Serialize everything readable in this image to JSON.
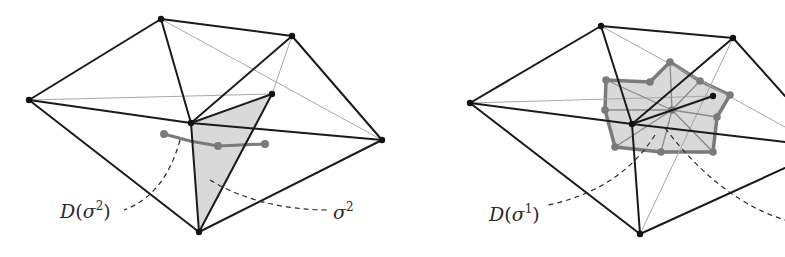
{
  "colors": {
    "edge": "#1a1a1a",
    "hidden_edge": "#a0a0a0",
    "fill": "#d9d9d9",
    "dual": "#7a7a7a",
    "vertex": "#111111"
  },
  "left_panel": {
    "label_dual": {
      "D": "D",
      "sigma": "σ",
      "exp": "2"
    },
    "label_simplex": {
      "sigma": "σ",
      "exp": "2"
    },
    "vertices": {
      "top": [
        161,
        19
      ],
      "upper_right": [
        292,
        36
      ],
      "left": [
        29,
        100
      ],
      "inner": [
        272,
        94
      ],
      "center": [
        191,
        123
      ],
      "right": [
        382,
        140
      ],
      "bottom": [
        199,
        232
      ]
    },
    "dual_curve_points": [
      [
        164,
        134
      ],
      [
        218,
        146
      ],
      [
        265,
        144
      ]
    ]
  },
  "right_panel": {
    "label_dual": {
      "D": "D",
      "sigma": "σ",
      "exp": "1"
    },
    "vertices": {
      "top": [
        601,
        26
      ],
      "upper_right": [
        733,
        38
      ],
      "left": [
        470,
        103
      ],
      "inner": [
        713,
        96
      ],
      "center": [
        632,
        124
      ],
      "right": [
        785,
        142
      ],
      "bottom": [
        640,
        234
      ]
    },
    "dual_polygon_points": [
      [
        606,
        80
      ],
      [
        650,
        82
      ],
      [
        670,
        62
      ],
      [
        700,
        81
      ],
      [
        730,
        95
      ],
      [
        717,
        117
      ],
      [
        713,
        152
      ],
      [
        661,
        152
      ],
      [
        615,
        147
      ],
      [
        605,
        110
      ]
    ],
    "dual_center": [
      672,
      110
    ]
  }
}
